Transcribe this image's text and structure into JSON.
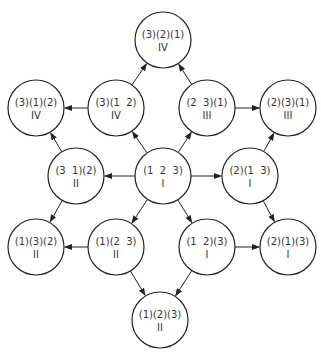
{
  "diagram": {
    "type": "directed-graph",
    "node_radius": 28,
    "colors": {
      "stroke": "#222222",
      "text": "#333333",
      "background": "#ffffff"
    },
    "nodes": [
      {
        "id": "n321",
        "perm": "(3)(2)(1)",
        "class": "IV",
        "x": 163,
        "y": 40
      },
      {
        "id": "n3_1_2",
        "perm": "(3)(1)(2)",
        "class": "IV",
        "x": 36,
        "y": 108
      },
      {
        "id": "n3_12",
        "perm": "(3)(1  2)",
        "class": "IV",
        "x": 116,
        "y": 108
      },
      {
        "id": "n23_1",
        "perm": "(2  3)(1)",
        "class": "III",
        "x": 207,
        "y": 108
      },
      {
        "id": "n2_3_1",
        "perm": "(2)(3)(1)",
        "class": "III",
        "x": 288,
        "y": 108
      },
      {
        "id": "n31_2",
        "perm": "(3  1)(2)",
        "class": "II",
        "x": 76,
        "y": 176
      },
      {
        "id": "n123",
        "perm": "(1  2  3)",
        "class": "I",
        "x": 163,
        "y": 176
      },
      {
        "id": "n2_13",
        "perm": "(2)(1  3)",
        "class": "I",
        "x": 250,
        "y": 176
      },
      {
        "id": "n1_3_2",
        "perm": "(1)(3)(2)",
        "class": "II",
        "x": 36,
        "y": 247
      },
      {
        "id": "n1_23",
        "perm": "(1)(2  3)",
        "class": "II",
        "x": 116,
        "y": 247
      },
      {
        "id": "n12_3",
        "perm": "(1  2)(3)",
        "class": "I",
        "x": 207,
        "y": 247
      },
      {
        "id": "n2_1_3",
        "perm": "(2)(1)(3)",
        "class": "I",
        "x": 288,
        "y": 247
      },
      {
        "id": "n1_2_3",
        "perm": "(1)(2)(3)",
        "class": "II",
        "x": 160,
        "y": 320
      }
    ],
    "edges": [
      {
        "from": "n123",
        "to": "n3_12"
      },
      {
        "from": "n123",
        "to": "n23_1"
      },
      {
        "from": "n123",
        "to": "n31_2"
      },
      {
        "from": "n123",
        "to": "n2_13"
      },
      {
        "from": "n123",
        "to": "n1_23"
      },
      {
        "from": "n123",
        "to": "n12_3"
      },
      {
        "from": "n3_12",
        "to": "n321"
      },
      {
        "from": "n3_12",
        "to": "n3_1_2"
      },
      {
        "from": "n23_1",
        "to": "n321"
      },
      {
        "from": "n23_1",
        "to": "n2_3_1"
      },
      {
        "from": "n31_2",
        "to": "n3_1_2"
      },
      {
        "from": "n31_2",
        "to": "n1_3_2"
      },
      {
        "from": "n2_13",
        "to": "n2_3_1"
      },
      {
        "from": "n2_13",
        "to": "n2_1_3"
      },
      {
        "from": "n1_23",
        "to": "n1_3_2"
      },
      {
        "from": "n1_23",
        "to": "n1_2_3"
      },
      {
        "from": "n12_3",
        "to": "n2_1_3"
      },
      {
        "from": "n12_3",
        "to": "n1_2_3"
      }
    ]
  }
}
